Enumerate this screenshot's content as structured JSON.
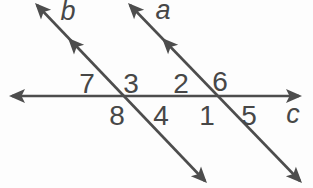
{
  "diagram": {
    "colors": {
      "stroke": "#4d4d4d",
      "label": "#474747",
      "background": "#fdfdfd"
    },
    "lines": {
      "a": {
        "label": "a"
      },
      "b": {
        "label": "b"
      },
      "c": {
        "label": "c"
      }
    },
    "angles": {
      "above_c": [
        {
          "label": "7",
          "position": "left of line b"
        },
        {
          "label": "3",
          "position": "right of line b"
        },
        {
          "label": "2",
          "position": "left of line a"
        },
        {
          "label": "6",
          "position": "right of line a"
        }
      ],
      "below_c": [
        {
          "label": "8",
          "position": "left of line b"
        },
        {
          "label": "4",
          "position": "right of line b"
        },
        {
          "label": "1",
          "position": "left of line a"
        },
        {
          "label": "5",
          "position": "right of line a"
        }
      ]
    }
  }
}
